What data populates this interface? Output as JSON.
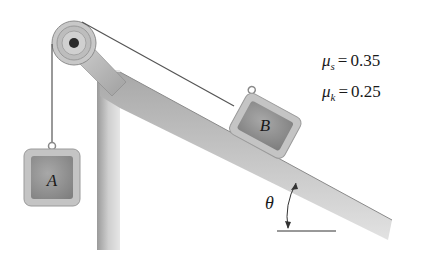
{
  "diagram": {
    "type": "physics-mechanics",
    "blocks": [
      {
        "id": "A",
        "label": "A",
        "position": "hanging"
      },
      {
        "id": "B",
        "label": "B",
        "position": "on incline"
      }
    ],
    "angle_label": "θ",
    "coefficients": {
      "static": {
        "symbol": "μ",
        "subscript": "s",
        "equals": "=",
        "value": "0.35"
      },
      "kinetic": {
        "symbol": "μ",
        "subscript": "k",
        "equals": "=",
        "value": "0.25"
      }
    },
    "colors": {
      "frame": "#b8b8b8",
      "block_outer": "#c4c4c4",
      "block_inner": "#8f8f8f",
      "rope": "#555555",
      "text": "#1a1a1a"
    }
  }
}
